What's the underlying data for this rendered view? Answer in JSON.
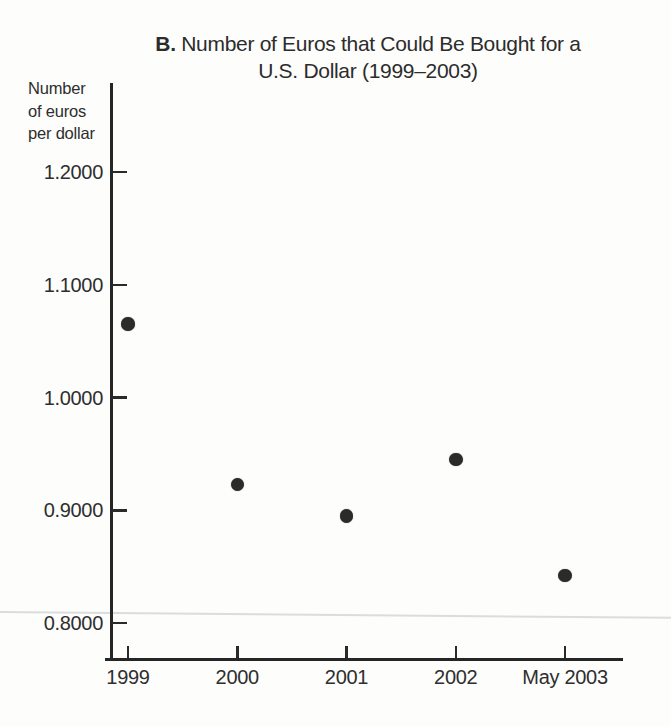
{
  "title": {
    "prefix": "B.",
    "line1": "Number of Euros that Could Be Bought for a",
    "line2": "U.S. Dollar (1999–2003)"
  },
  "y_axis_unit": {
    "line1": "Number",
    "line2": "of euros",
    "line3": "per dollar"
  },
  "colors": {
    "axis": "#262626",
    "text": "#2e2e2e",
    "point": "#2b2b2b",
    "artifact_line": "#dcdcdc",
    "background": "#fdfdfc"
  },
  "chart_data": {
    "type": "scatter",
    "title": "B. Number of Euros that Could Be Bought for a U.S. Dollar (1999–2003)",
    "ylabel": "Number of euros per dollar",
    "xlabel": "",
    "categories": [
      "1999",
      "2000",
      "2001",
      "2002",
      "May 2003"
    ],
    "values": [
      1.065,
      0.923,
      0.895,
      0.945,
      0.842
    ],
    "y_ticks": [
      "1.2000",
      "1.1000",
      "1.0000",
      "0.9000",
      "0.8000"
    ],
    "y_tick_values": [
      1.2,
      1.1,
      1.0,
      0.9,
      0.8
    ],
    "ylim": [
      0.77,
      1.28
    ],
    "grid": false,
    "legend": null
  }
}
